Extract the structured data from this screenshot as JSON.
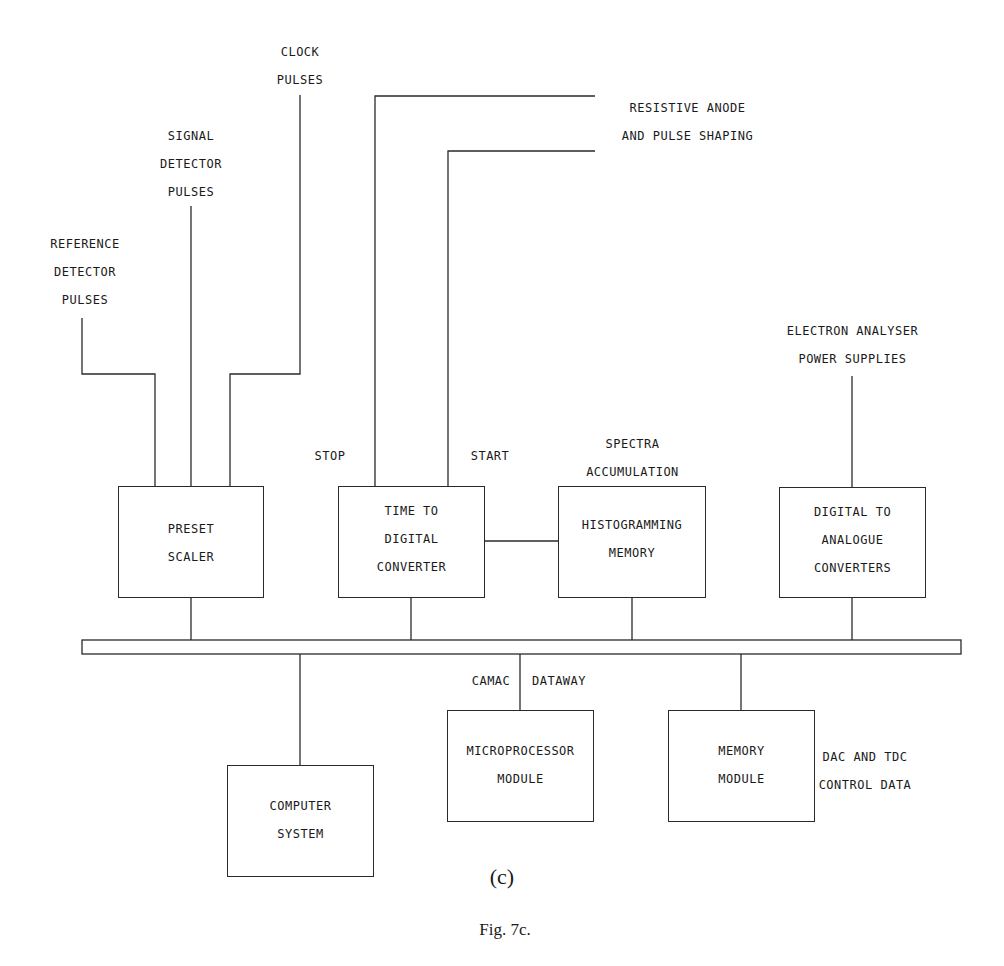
{
  "figure": {
    "subcaption": "(c)",
    "caption": "Fig. 7c."
  },
  "inputs": {
    "reference": [
      "REFERENCE",
      "DETECTOR",
      "PULSES"
    ],
    "signal": [
      "SIGNAL",
      "DETECTOR",
      "PULSES"
    ],
    "clock": [
      "CLOCK",
      "PULSES"
    ],
    "anode": [
      "RESISTIVE ANODE",
      "AND PULSE SHAPING"
    ],
    "analyser": [
      "ELECTRON ANALYSER",
      "POWER SUPPLIES"
    ]
  },
  "signal_labels": {
    "stop": "STOP",
    "start": "START",
    "spectra": [
      "SPECTRA",
      "ACCUMULATION"
    ],
    "bus_left": "CAMAC",
    "bus_right": "DATAWAY",
    "control": [
      "DAC AND TDC",
      "CONTROL DATA"
    ]
  },
  "blocks": {
    "preset_scaler": [
      "PRESET",
      "SCALER"
    ],
    "tdc": [
      "TIME TO",
      "DIGITAL",
      "CONVERTER"
    ],
    "histogram": [
      "HISTOGRAMMING",
      "MEMORY"
    ],
    "dac": [
      "DIGITAL TO",
      "ANALOGUE",
      "CONVERTERS"
    ],
    "computer": [
      "COMPUTER",
      "SYSTEM"
    ],
    "microprocessor": [
      "MICROPROCESSOR",
      "MODULE"
    ],
    "memory": [
      "MEMORY",
      "MODULE"
    ]
  },
  "colors": {
    "line": "#2a2a2a",
    "text": "#1a1a1a",
    "background": "#ffffff"
  }
}
